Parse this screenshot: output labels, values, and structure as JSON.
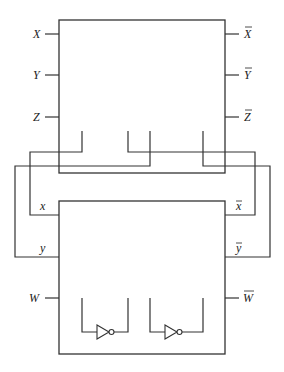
{
  "diagram": {
    "type": "logic-circuit",
    "line_color": "#333333",
    "background": "#ffffff",
    "top_block": {
      "inputs": [
        {
          "label": "X",
          "overline": false
        },
        {
          "label": "Y",
          "overline": false
        },
        {
          "label": "Z",
          "overline": false
        }
      ],
      "outputs": [
        {
          "label": "X",
          "overline": true
        },
        {
          "label": "Y",
          "overline": true
        },
        {
          "label": "Z",
          "overline": true
        }
      ]
    },
    "bottom_block": {
      "inputs": [
        {
          "label": "x",
          "overline": false
        },
        {
          "label": "y",
          "overline": false
        },
        {
          "label": "W",
          "overline": false
        }
      ],
      "outputs": [
        {
          "label": "x",
          "overline": true
        },
        {
          "label": "y",
          "overline": true
        },
        {
          "label": "W",
          "overline": true
        }
      ],
      "gates": [
        {
          "type": "inverter",
          "name": "NOT-1"
        },
        {
          "type": "inverter",
          "name": "NOT-2"
        }
      ]
    },
    "connections": [
      {
        "from": "top-block-stub-1",
        "to": "x"
      },
      {
        "from": "top-block-stub-2",
        "to": "x-bar"
      },
      {
        "from": "top-block-stub-3",
        "to": "y"
      },
      {
        "from": "top-block-stub-4",
        "to": "y-bar"
      }
    ]
  }
}
